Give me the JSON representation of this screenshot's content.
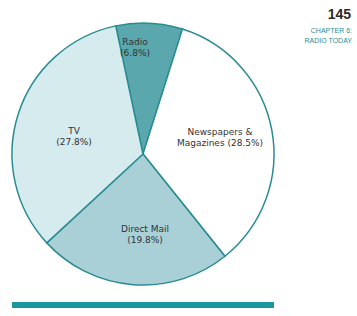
{
  "page": {
    "number": "145",
    "chapter_line1": "CHAPTER 6:",
    "chapter_line2": "RADIO TODAY"
  },
  "colors": {
    "radio": "#5aa7ae",
    "newspapers": "#ffffff",
    "direct_mail": "#a9d0d6",
    "tv": "#d5ebee",
    "stroke": "#2a8c93",
    "bar": "#1b979d"
  },
  "chart_data": {
    "type": "pie",
    "title": "",
    "slices": [
      {
        "label": "Radio",
        "value": 6.8
      },
      {
        "label": "Newspapers & Magazines",
        "value": 28.5
      },
      {
        "label": "Direct Mail",
        "value": 19.8
      },
      {
        "label": "TV",
        "value": 27.8
      }
    ],
    "labels": {
      "radio": [
        "Radio",
        "(6.8%)"
      ],
      "newspapers": [
        "Newspapers &",
        "Magazines (28.5%)"
      ],
      "direct_mail": [
        "Direct Mail",
        "(19.8%)"
      ],
      "tv": [
        "TV",
        "(27.8%)"
      ]
    }
  }
}
